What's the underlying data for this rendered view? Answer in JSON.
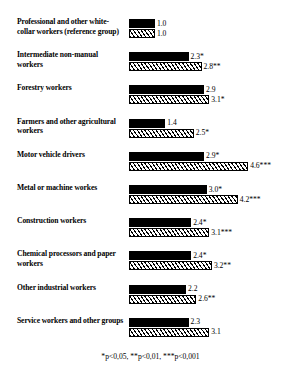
{
  "chart_data": {
    "type": "bar",
    "orientation": "horizontal",
    "title": "",
    "xlabel": "",
    "ylabel": "",
    "xlim": [
      0,
      4.6
    ],
    "grid": false,
    "legend": "none",
    "categories": [
      "Professional and other white-collar workers (reference group)",
      "Intermediate non-manual workers",
      "Forestry workers",
      "Farmers and other agricultural workers",
      "Motor vehicle drivers",
      "Metal or machine workes",
      "Construction workers",
      "Chemical processors and paper workers",
      "Other industrial workers",
      "Service workers and other groups"
    ],
    "series": [
      {
        "name": "solid",
        "values": [
          1.0,
          2.3,
          2.9,
          1.4,
          2.9,
          3.0,
          2.4,
          2.4,
          2.2,
          2.3
        ],
        "labels": [
          "1.0",
          "2.3*",
          "2.9",
          "1.4",
          "2.9*",
          "3.0*",
          "2.4*",
          "2.4*",
          "2.2",
          "2.3"
        ]
      },
      {
        "name": "hatched",
        "values": [
          1.0,
          2.8,
          3.1,
          2.5,
          4.6,
          4.2,
          3.1,
          3.2,
          2.6,
          3.1
        ],
        "labels": [
          "1.0",
          "2.8**",
          "3.1*",
          "2.5*",
          "4.6***",
          "4.2***",
          "3.1***",
          "3.2**",
          "2.6**",
          "3.1"
        ]
      }
    ],
    "footnote": "*p<0,05, **p<0,01, ***p<0,001"
  },
  "rows": [
    {
      "label": "Professional and other white-collar workers (reference group)",
      "solid_value": 1.0,
      "solid_label": "1.0",
      "hatched_value": 1.0,
      "hatched_label": "1.0"
    },
    {
      "label": "Intermediate non-manual workers",
      "solid_value": 2.3,
      "solid_label": "2.3*",
      "hatched_value": 2.8,
      "hatched_label": "2.8**"
    },
    {
      "label": "Forestry workers",
      "solid_value": 2.9,
      "solid_label": "2.9",
      "hatched_value": 3.1,
      "hatched_label": "3.1*"
    },
    {
      "label": "Farmers and other agricultural workers",
      "solid_value": 1.4,
      "solid_label": "1.4",
      "hatched_value": 2.5,
      "hatched_label": "2.5*"
    },
    {
      "label": "Motor vehicle drivers",
      "solid_value": 2.9,
      "solid_label": "2.9*",
      "hatched_value": 4.6,
      "hatched_label": "4.6***"
    },
    {
      "label": "Metal or machine workes",
      "solid_value": 3.0,
      "solid_label": "3.0*",
      "hatched_value": 4.2,
      "hatched_label": "4.2***"
    },
    {
      "label": "Construction workers",
      "solid_value": 2.4,
      "solid_label": "2.4*",
      "hatched_value": 3.1,
      "hatched_label": "3.1***"
    },
    {
      "label": "Chemical processors and paper workers",
      "solid_value": 2.4,
      "solid_label": "2.4*",
      "hatched_value": 3.2,
      "hatched_label": "3.2**"
    },
    {
      "label": "Other industrial workers",
      "solid_value": 2.2,
      "solid_label": "2.2",
      "hatched_value": 2.6,
      "hatched_label": "2.6**"
    },
    {
      "label": "Service workers and other groups",
      "solid_value": 2.3,
      "solid_label": "2.3",
      "hatched_value": 3.1,
      "hatched_label": "3.1"
    }
  ],
  "footnote": "*p<0,05, **p<0,01, ***p<0,001"
}
